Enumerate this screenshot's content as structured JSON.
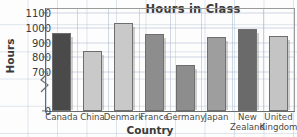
{
  "chart_data": {
    "type": "bar",
    "title": "Hours in Class",
    "xlabel": "Country",
    "ylabel": "Hours",
    "categories": [
      "Canada",
      "China",
      "Denmark",
      "France",
      "Germany",
      "Japan",
      "New\nZealand",
      "United\nKingdom"
    ],
    "values": [
      965,
      840,
      1030,
      960,
      750,
      935,
      995,
      945
    ],
    "ylim": [
      700,
      1100
    ],
    "y_axis_break": true,
    "y_break_from": 0,
    "y_break_to": 700,
    "yticks": [
      "1100",
      "1000",
      "900",
      "800",
      "700",
      "0"
    ],
    "ytick_values": [
      1100,
      1000,
      900,
      800,
      700,
      0
    ],
    "grid": true,
    "legend": "none",
    "bar_colors": [
      "#4a4a4a",
      "#c9c9c9",
      "#c9c9c9",
      "#8d8d8d",
      "#8d8d8d",
      "#9e9e9e",
      "#6a6a6a",
      "#c4c4c4"
    ],
    "axis_color": "#6b6b6b",
    "grid_color": "#96aac3",
    "text_color": "#3a3a3a"
  }
}
